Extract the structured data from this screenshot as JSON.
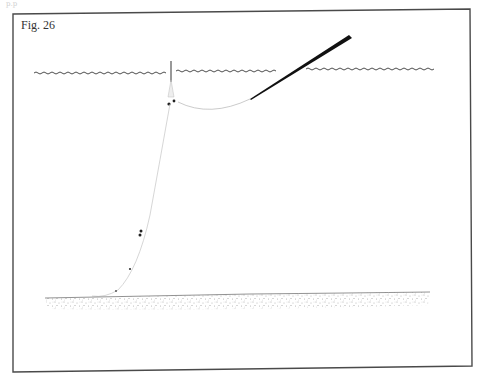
{
  "page": {
    "header_text": "p.p"
  },
  "figure": {
    "label": "Fig. 26",
    "elements": {
      "water_surface": {
        "icon": "wavy-line",
        "color": "#3a3a3a"
      },
      "fishing_rod": {
        "icon": "tapered-rod",
        "color": "#111111"
      },
      "fishing_line": {
        "color": "#9a9a9a"
      },
      "float": {
        "icon": "float-stick"
      },
      "weights": {
        "icon": "split-shot-dots",
        "color": "#222222"
      },
      "seabed": {
        "icon": "stippled-ground",
        "color": "#555555"
      }
    }
  }
}
